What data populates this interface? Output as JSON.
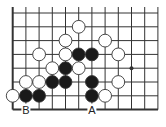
{
  "diagram": {
    "type": "go-board-corner",
    "grid": {
      "origin_x": 12.7,
      "origin_y": 13,
      "spacing_x": 13.2,
      "spacing_y": 13.8,
      "cols": 12,
      "rows": 8,
      "left_edge": true,
      "bottom_edge": true,
      "right_extent": 158,
      "top_extent": 7
    },
    "colors": {
      "line": "#333333",
      "black_stone": "#1a1a1a",
      "white_stone": "#ffffff",
      "stone_outline": "#333333"
    },
    "star_points": [
      {
        "col": 9,
        "row": 4
      }
    ],
    "stones": [
      {
        "color": "white",
        "col": 5,
        "row": 1
      },
      {
        "color": "white",
        "col": 4,
        "row": 2
      },
      {
        "color": "white",
        "col": 7,
        "row": 2
      },
      {
        "color": "white",
        "col": 2,
        "row": 3
      },
      {
        "color": "white",
        "col": 4,
        "row": 3
      },
      {
        "color": "black",
        "col": 5,
        "row": 3
      },
      {
        "color": "black",
        "col": 6,
        "row": 3
      },
      {
        "color": "white",
        "col": 8,
        "row": 3
      },
      {
        "color": "white",
        "col": 3,
        "row": 4
      },
      {
        "color": "black",
        "col": 4,
        "row": 4
      },
      {
        "color": "white",
        "col": 5,
        "row": 4
      },
      {
        "color": "white",
        "col": 1,
        "row": 5
      },
      {
        "color": "white",
        "col": 2,
        "row": 5
      },
      {
        "color": "black",
        "col": 3,
        "row": 5
      },
      {
        "color": "black",
        "col": 4,
        "row": 5
      },
      {
        "color": "black",
        "col": 6,
        "row": 5
      },
      {
        "color": "white",
        "col": 8,
        "row": 5
      },
      {
        "color": "white",
        "col": 0,
        "row": 6
      },
      {
        "color": "black",
        "col": 1,
        "row": 6
      },
      {
        "color": "black",
        "col": 2,
        "row": 6
      },
      {
        "color": "black",
        "col": 6,
        "row": 6
      },
      {
        "color": "white",
        "col": 7,
        "row": 6
      }
    ],
    "labels": [
      {
        "text": "B",
        "col": 1,
        "row": 7
      },
      {
        "text": "A",
        "col": 6,
        "row": 7
      }
    ]
  }
}
